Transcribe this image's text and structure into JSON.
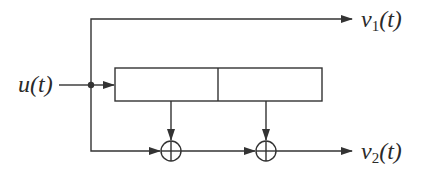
{
  "diagram": {
    "type": "convolutional-encoder",
    "input": {
      "label": "u(t)"
    },
    "outputs": [
      {
        "label_base": "v",
        "label_sub": "1",
        "label_arg": "(t)"
      },
      {
        "label_base": "v",
        "label_sub": "2",
        "label_arg": "(t)"
      }
    ],
    "shift_register": {
      "cells": 2
    },
    "adders": [
      {
        "symbol": "modulo-2-adder"
      },
      {
        "symbol": "modulo-2-adder"
      }
    ],
    "colors": {
      "stroke": "#333333",
      "text": "#2a2a2a",
      "background": "#ffffff"
    }
  }
}
